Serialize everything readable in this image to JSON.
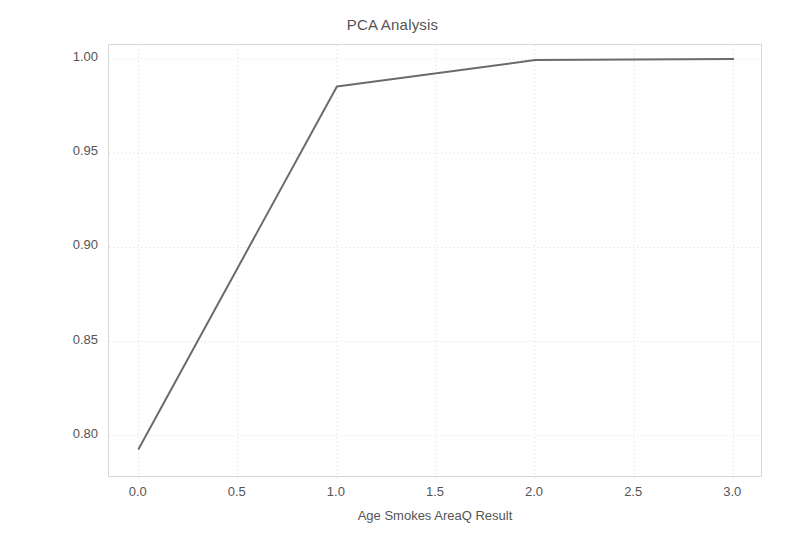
{
  "figure": {
    "background_color": "#ffffff",
    "caption_partial": ""
  },
  "chart_data": {
    "type": "line",
    "title": "PCA Analysis",
    "xlabel": "Age Smokes AreaQ Result",
    "ylabel": "% Variance Explained",
    "x": [
      0.0,
      1.0,
      2.0,
      3.0
    ],
    "values": [
      0.793,
      0.9855,
      0.9995,
      1.0
    ],
    "series": [
      {
        "name": "Cumulative explained variance",
        "x": [
          0.0,
          1.0,
          2.0,
          3.0
        ],
        "values": [
          0.793,
          0.9855,
          0.9995,
          1.0
        ],
        "color": "#6b6b6b",
        "line_width": 2
      }
    ],
    "xlim": [
      -0.15,
      3.15
    ],
    "ylim": [
      0.7775,
      1.0075
    ],
    "xticks": [
      0.0,
      0.5,
      1.0,
      1.5,
      2.0,
      2.5,
      3.0
    ],
    "xticklabels": [
      "0.0",
      "0.5",
      "1.0",
      "1.5",
      "2.0",
      "2.5",
      "3.0"
    ],
    "yticks": [
      0.8,
      0.85,
      0.9,
      0.95,
      1.0
    ],
    "yticklabels": [
      "0.80",
      "0.85",
      "0.90",
      "0.95",
      "1.00"
    ],
    "grid": true,
    "grid_style": "dotted",
    "grid_color": "#d9d9d9",
    "legend": false,
    "legend_position": "none",
    "markers": false,
    "frame_color": "#d8d8d8"
  }
}
